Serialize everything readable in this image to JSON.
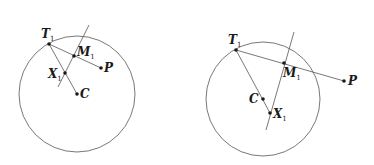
{
  "figures": [
    {
      "id": "left",
      "circle": {
        "cx": 77,
        "cy": 94,
        "r": 58
      },
      "points": {
        "T": {
          "x": 49,
          "y": 44,
          "label": "T",
          "sub": "1"
        },
        "M": {
          "x": 74,
          "y": 56,
          "label": "M",
          "sub": "1"
        },
        "P": {
          "x": 101,
          "y": 68,
          "label": "P",
          "sub": ""
        },
        "X": {
          "x": 65,
          "y": 73,
          "label": "X",
          "sub": "1"
        },
        "C": {
          "x": 77,
          "y": 94,
          "label": "C",
          "sub": ""
        }
      },
      "bisector": {
        "x1": 89,
        "y1": 25,
        "x2": 58,
        "y2": 87
      }
    },
    {
      "id": "right",
      "circle": {
        "cx": 263,
        "cy": 99,
        "r": 57
      },
      "points": {
        "T": {
          "x": 236,
          "y": 50,
          "label": "T",
          "sub": "1"
        },
        "M": {
          "x": 284,
          "y": 63,
          "label": "M",
          "sub": "1"
        },
        "P": {
          "x": 344,
          "y": 81,
          "label": "P",
          "sub": ""
        },
        "X": {
          "x": 270,
          "y": 113,
          "label": "X",
          "sub": "1"
        },
        "C": {
          "x": 263,
          "y": 99,
          "label": "C",
          "sub": ""
        }
      },
      "bisector": {
        "x1": 294,
        "y1": 32,
        "x2": 266,
        "y2": 130
      }
    }
  ],
  "labels": {
    "left": {
      "T": "T",
      "T_sub": "1",
      "M": "M",
      "M_sub": "1",
      "P": "P",
      "X": "X",
      "X_sub": "1",
      "C": "C"
    },
    "right": {
      "T": "T",
      "T_sub": "1",
      "M": "M",
      "M_sub": "1",
      "P": "P",
      "X": "X",
      "X_sub": "1",
      "C": "C"
    }
  },
  "colors": {
    "stroke": "#555555",
    "point": "#1a1a1a",
    "text": "#1a1a1a"
  }
}
